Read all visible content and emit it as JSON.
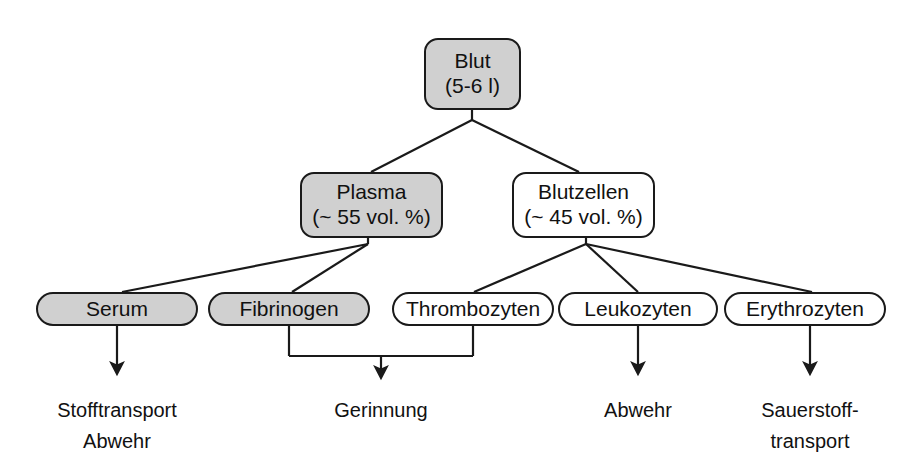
{
  "diagram": {
    "title": "Blut",
    "type": "hierarchy-tree",
    "colors": {
      "background": "#ffffff",
      "stroke": "#1a1a1a",
      "shaded_fill": "#d0d0d0",
      "plain_fill": "#ffffff",
      "text": "#111111"
    },
    "nodes": {
      "blut": {
        "line1": "Blut",
        "line2": "(5-6 l)"
      },
      "plasma": {
        "line1": "Plasma",
        "line2": "(~ 55 vol. %)"
      },
      "blutzellen": {
        "line1": "Blutzellen",
        "line2": "(~ 45 vol. %)"
      },
      "serum": {
        "line1": "Serum"
      },
      "fibrinogen": {
        "line1": "Fibrinogen"
      },
      "thrombozyten": {
        "line1": "Thrombozyten"
      },
      "leukozyten": {
        "line1": "Leukozyten"
      },
      "erythrozyten": {
        "line1": "Erythrozyten"
      }
    },
    "outcomes": {
      "serum_function": "Stofftransport\nAbwehr",
      "gerinnung": "Gerinnung",
      "leukozyten_function": "Abwehr",
      "erythrozyten_function": "Sauerstoff-\ntransport"
    }
  }
}
